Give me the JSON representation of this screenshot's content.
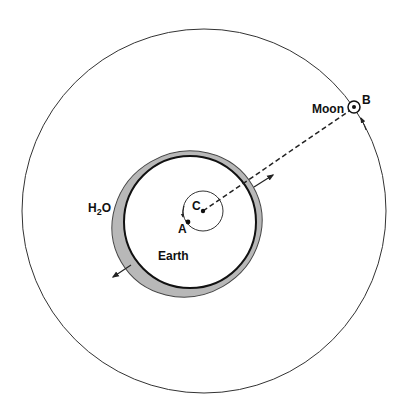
{
  "labels": {
    "moon": "Moon",
    "b": "B",
    "c": "C",
    "a": "A",
    "earth": "Earth",
    "h2o_h": "H",
    "h2o_sub": "2",
    "h2o_o": "O"
  },
  "colors": {
    "line": "#222222",
    "water": "#b8b8b8",
    "background": "#ffffff"
  }
}
